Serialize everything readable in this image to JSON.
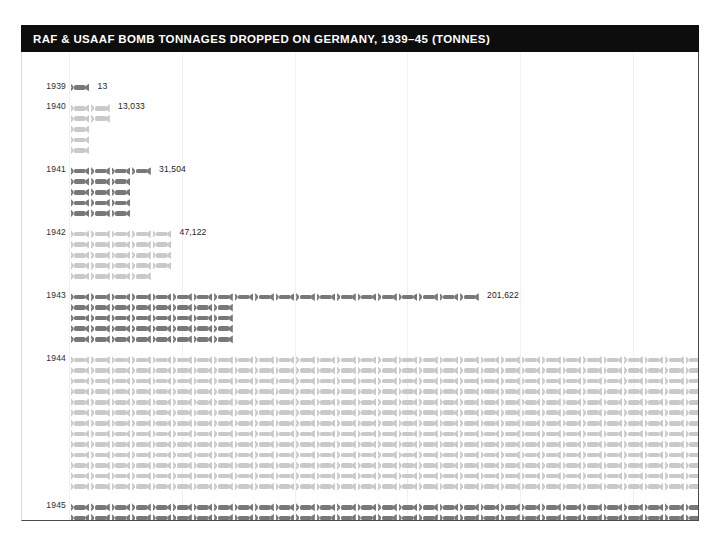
{
  "header": {
    "title": "RAF & USAAF BOMB TONNAGES DROPPED ON GERMANY, 1939–45 (TONNES)"
  },
  "chart_data": {
    "type": "bar",
    "title": "RAF & USAAF BOMB TONNAGES DROPPED ON GERMANY, 1939–45 (TONNES)",
    "subtitle": "",
    "xlabel": "",
    "ylabel": "",
    "unit": "tonnes",
    "pictogram": true,
    "icon": "bomb-icon",
    "icons_per_row": 33,
    "tonnes_per_icon": 1000,
    "categories": [
      "1939",
      "1940",
      "1941",
      "1942",
      "1943",
      "1944",
      "1945"
    ],
    "values": [
      13,
      13033,
      31504,
      47122,
      201622,
      914637,
      380113
    ],
    "value_labels": [
      "13",
      "13,033",
      "31,504",
      "47,122",
      "201,622",
      "914,637",
      "380,113"
    ],
    "legend": [],
    "grid": true,
    "series": [
      {
        "name": "Bomb tonnage dropped on Germany",
        "values": [
          13,
          13033,
          31504,
          47122,
          201622,
          914637,
          380113
        ]
      }
    ],
    "colors": {
      "icon_dark": "#787878",
      "icon_light": "#c9c9c9",
      "header_background": "#0d0d0d",
      "header_text": "#ffffff",
      "gridline": "#f1f1f1",
      "label_text": "#222222"
    }
  },
  "rows": [
    {
      "year": "1939",
      "label": "13",
      "shade": "dark",
      "icons": [
        1
      ]
    },
    {
      "year": "1940",
      "label": "13,033",
      "shade": "light",
      "icons": [
        2,
        2,
        1,
        1,
        1
      ]
    },
    {
      "year": "1941",
      "label": "31,504",
      "shade": "dark",
      "icons": [
        4,
        3,
        3,
        3,
        3
      ]
    },
    {
      "year": "1942",
      "label": "47,122",
      "shade": "light",
      "icons": [
        5,
        5,
        5,
        5,
        4
      ]
    },
    {
      "year": "1943",
      "label": "201,622",
      "shade": "dark",
      "icons": [
        20,
        8,
        8,
        8,
        8
      ]
    },
    {
      "year": "1944",
      "label": "914,637",
      "shade": "light",
      "icons": [
        33,
        33,
        33,
        33,
        33,
        33,
        33,
        33,
        33,
        33,
        33,
        33,
        33
      ]
    },
    {
      "year": "1945",
      "label": "380,113",
      "shade": "dark",
      "icons": [
        33,
        33,
        33,
        33,
        33,
        15,
        15,
        15,
        15,
        15
      ]
    }
  ]
}
